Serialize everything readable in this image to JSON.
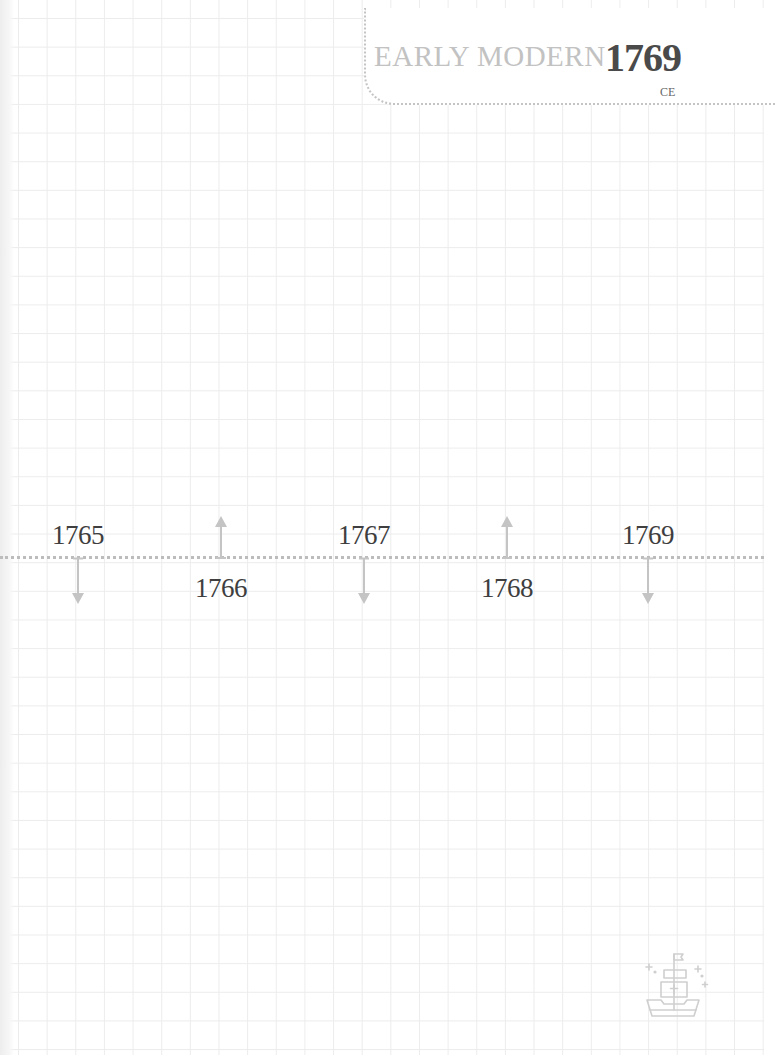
{
  "header": {
    "era": "EARLY MODERN",
    "year": "1769",
    "era_suffix": "CE"
  },
  "timeline": {
    "line_color": "#bcbcbc",
    "arrow_color": "#c4c4c4",
    "ticks": [
      {
        "label": "1765",
        "x": 78,
        "label_position": "above",
        "arrow": "down"
      },
      {
        "label": "1766",
        "x": 221,
        "label_position": "below",
        "arrow": "up"
      },
      {
        "label": "1767",
        "x": 364,
        "label_position": "above",
        "arrow": "down"
      },
      {
        "label": "1768",
        "x": 507,
        "label_position": "below",
        "arrow": "up"
      },
      {
        "label": "1769",
        "x": 648,
        "label_position": "above",
        "arrow": "down"
      }
    ]
  },
  "decoration": {
    "icon": "ship-icon"
  },
  "colors": {
    "grid": "#ececec",
    "text_dark": "#3e3e3e",
    "text_light": "#c2c2c2"
  }
}
